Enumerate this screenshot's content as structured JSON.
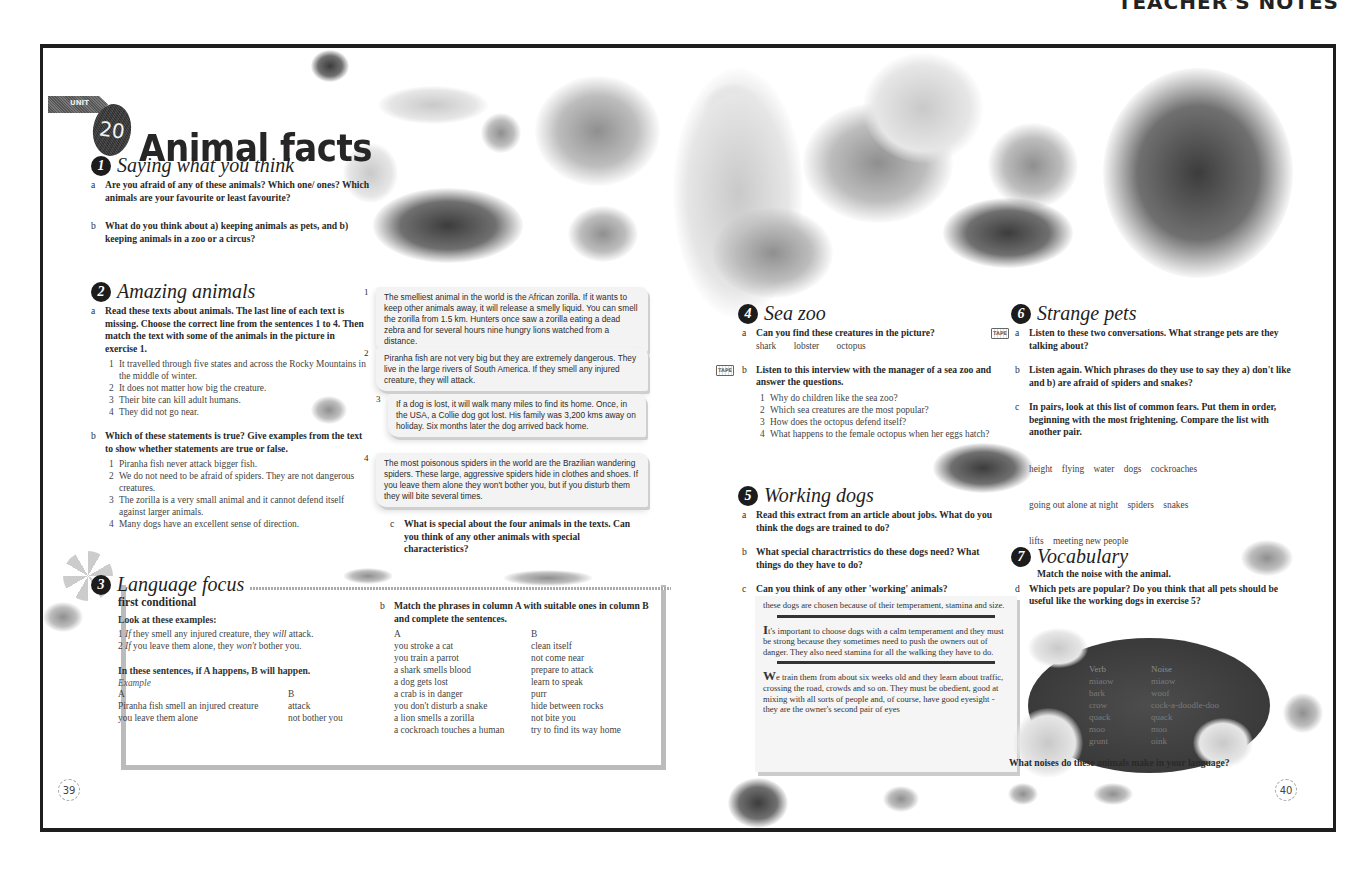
{
  "header": {
    "label": "TEACHER'S NOTES"
  },
  "unit": {
    "tab_label": "UNIT",
    "number": "20",
    "title": "Animal facts"
  },
  "section1": {
    "number": "1",
    "title": "Saying what you think",
    "questions": [
      {
        "letter": "a",
        "text": "Are you afraid of any of these animals? Which one/ ones? Which animals are your favourite or least favourite?"
      },
      {
        "letter": "b",
        "text": "What do you think about a) keeping animals as pets, and b) keeping animals in a zoo or a circus?"
      }
    ]
  },
  "section2": {
    "number": "2",
    "title": "Amazing animals",
    "a": {
      "letter": "a",
      "text": "Read these texts about animals. The last line of each text is missing. Choose the correct line from the sentences 1 to 4. Then match the text with some of the animals in the picture in exercise 1.",
      "items": [
        {
          "n": "1",
          "text": "It travelled through five states and across the Rocky Mountains in the middle of winter."
        },
        {
          "n": "2",
          "text": "It does not matter how big the creature."
        },
        {
          "n": "3",
          "text": "Their bite can kill adult humans."
        },
        {
          "n": "4",
          "text": "They did not go near."
        }
      ]
    },
    "b": {
      "letter": "b",
      "text": "Which of these statements is true? Give examples from the text to show whether statements are true or false.",
      "items": [
        {
          "n": "1",
          "text": "Piranha fish never attack bigger fish."
        },
        {
          "n": "2",
          "text": "We do not need to be afraid of spiders. They are not dangerous creatures."
        },
        {
          "n": "3",
          "text": "The zorilla is a very small animal and it cannot defend itself against larger animals."
        },
        {
          "n": "4",
          "text": "Many dogs have an excellent sense of direction."
        }
      ]
    },
    "texts": [
      {
        "n": "1",
        "text": "The smelliest animal in the world is the African zorilla. If it wants to keep other animals away, it will release a smelly liquid. You can smell the zorilla from 1.5 km. Hunters once saw a zorilla eating a dead zebra and for several hours nine hungry lions watched from a distance."
      },
      {
        "n": "2",
        "text": "Piranha fish are not very big but they are extremely dangerous. They live in the large rivers of South America. If they smell any injured creature, they will attack."
      },
      {
        "n": "3",
        "text": "If a dog is lost, it will walk many miles to find its home. Once, in the USA, a Collie dog got lost. His family was 3,200 kms away on holiday. Six months later the dog arrived back home."
      },
      {
        "n": "4",
        "text": "The most poisonous spiders in the world are the Brazilian wandering spiders. These large, aggressive spiders hide in clothes and shoes. If you leave them alone they won't bother you, but if you disturb them they will bite several times."
      }
    ],
    "c": {
      "letter": "c",
      "text": "What is special about the four animals in the texts. Can you think of any other animals with special characteristics?"
    }
  },
  "section3": {
    "number": "3",
    "title": "Language focus",
    "subtitle": "first conditional",
    "look_label": "Look at these examples:",
    "examples": [
      {
        "n": "1",
        "if": "If",
        "pre": " they smell any injured creature, they ",
        "modal": "will",
        "post": " attack."
      },
      {
        "n": "2",
        "if": "If",
        "pre": " you leave them alone, they ",
        "modal": "won't",
        "post": " bother you."
      }
    ],
    "rule": "In these sentences, if A happens, B will happen.",
    "example_label": "Example",
    "example_table": {
      "headers": [
        "A",
        "B"
      ],
      "rows": [
        [
          "Piranha fish smell an injured creature",
          "attack"
        ],
        [
          "you leave them alone",
          "not bother you"
        ]
      ]
    },
    "b": {
      "letter": "b",
      "text": "Match the phrases in column A with suitable ones in column B and complete the sentences.",
      "headers": [
        "A",
        "B"
      ],
      "col_a": [
        "you stroke a cat",
        "you train a parrot",
        "a shark smells blood",
        "a dog gets lost",
        "a crab is in danger",
        "you don't disturb a snake",
        "a lion smells a zorilla",
        "a cockroach touches a human"
      ],
      "col_b": [
        "clean itself",
        "not come near",
        "prepare to attack",
        "learn to speak",
        "purr",
        "hide between rocks",
        "not bite you",
        "try to find its way home"
      ]
    }
  },
  "section4": {
    "number": "4",
    "title": "Sea zoo",
    "a": {
      "letter": "a",
      "text": "Can you find these creatures in the picture?",
      "words": [
        "shark",
        "lobster",
        "octopus"
      ]
    },
    "b": {
      "letter": "b",
      "text": "Listen to this interview with the manager of a sea zoo and answer the questions.",
      "items": [
        {
          "n": "1",
          "text": "Why do children like the sea zoo?"
        },
        {
          "n": "2",
          "text": "Which sea creatures are the most popular?"
        },
        {
          "n": "3",
          "text": "How does the octopus defend itself?"
        },
        {
          "n": "4",
          "text": "What happens to the female octopus when her eggs hatch?"
        }
      ]
    }
  },
  "section5": {
    "number": "5",
    "title": "Working dogs",
    "questions": [
      {
        "letter": "a",
        "text": "Read this extract from an article about jobs. What do you think the dogs are trained to do?"
      },
      {
        "letter": "b",
        "text": "What special charactrristics do these dogs need? What things do they have to do?"
      },
      {
        "letter": "c",
        "text": "Can you think of any other 'working' animals?"
      }
    ],
    "article": {
      "intro": "these dogs are chosen because of their temperament, stamina and size.",
      "para1_cap": "I",
      "para1": "t's important to choose dogs with a calm temperament and they must be strong because they sometimes need to push the owners out of danger. They also need stamina for all the walking they have to do.",
      "para2_cap": "W",
      "para2": "e train them from about six weeks old and they learn about traffic, crossing the  road, crowds and so on. They must be obedient, good at mixing with all sorts of people and, of course, have good eyesight - they are the owner's second pair of eyes"
    }
  },
  "section6": {
    "number": "6",
    "title": "Strange pets",
    "questions": [
      {
        "letter": "a",
        "text": "Listen to these two conversations. What strange pets are they talking about?"
      },
      {
        "letter": "b",
        "text": "Listen again. Which phrases do they use to say they a) don't like and b) are afraid of spiders and snakes?"
      },
      {
        "letter": "c",
        "text": "In pairs, look at this list of common fears. Put them in order, beginning with the most frightening. Compare the list with another pair."
      },
      {
        "letter": "d",
        "text": "Which pets are popular? Do you think that all pets should be useful like the working dogs in exercise 5?"
      }
    ],
    "fears": {
      "line1": "height    flying    water    dogs    cockroaches",
      "line2": "going out alone at night    spiders    snakes",
      "line3": "lifts    meeting new people"
    }
  },
  "section7": {
    "number": "7",
    "title": "Vocabulary",
    "instruction": "Match the noise with the animal.",
    "headers": [
      "Verb",
      "Noise"
    ],
    "verbs": [
      "miaow",
      "bark",
      "crow",
      "quack",
      "moo",
      "grunt"
    ],
    "noises": [
      "miaow",
      "woof",
      "cock-a-doodle-doo",
      "quack",
      "moo",
      "oink"
    ],
    "question": "What noises do these animals make in your language?"
  },
  "tape_icon_label": "TAPE",
  "pages": {
    "left": "39",
    "right": "40"
  },
  "illustrations": [
    "spider",
    "lizard",
    "wasp",
    "shark",
    "dog",
    "cockroach",
    "beetle",
    "fish",
    "octopus",
    "camel",
    "lion",
    "elephant",
    "lobster",
    "skunk",
    "millipede",
    "snail",
    "ants",
    "ladybird",
    "farm-animals"
  ]
}
